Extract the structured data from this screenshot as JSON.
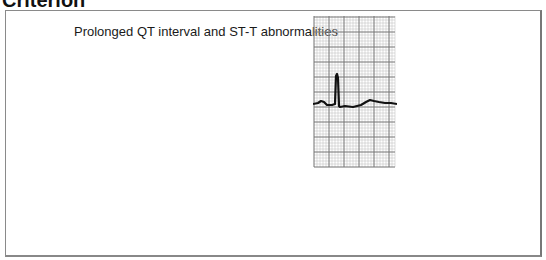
{
  "heading": "Criterion",
  "panel": {
    "label": "Prolonged QT interval and ST-T abnormalities",
    "figure": {
      "type": "ecg-strip",
      "description": "ECG trace on grid paper showing a QRS complex followed by a prolonged ST-T segment"
    }
  }
}
